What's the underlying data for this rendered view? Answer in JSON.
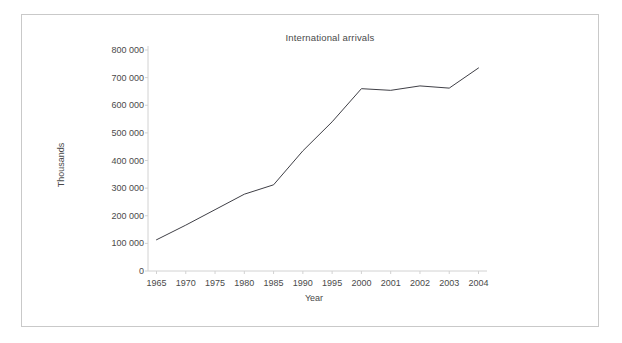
{
  "chart_data": {
    "type": "line",
    "title": "International arrivals",
    "xlabel": "Year",
    "ylabel": "Thousands",
    "categories": [
      "1965",
      "1970",
      "1975",
      "1980",
      "1985",
      "1990",
      "1995",
      "2000",
      "2001",
      "2002",
      "2003",
      "2004"
    ],
    "values": [
      113000,
      166000,
      222000,
      278000,
      312000,
      435000,
      540000,
      660000,
      654000,
      670000,
      662000,
      735000
    ],
    "series": [
      {
        "name": "International arrivals",
        "values": [
          113000,
          166000,
          222000,
          278000,
          312000,
          435000,
          540000,
          660000,
          654000,
          670000,
          662000,
          735000
        ]
      }
    ],
    "ylim": [
      0,
      800000
    ],
    "ytick_values": [
      0,
      100000,
      200000,
      300000,
      400000,
      500000,
      600000,
      700000,
      800000
    ],
    "ytick_labels": [
      "0",
      "100 000",
      "200 000",
      "300 000",
      "400 000",
      "500 000",
      "600 000",
      "700 000",
      "800 000"
    ],
    "grid": false,
    "legend": "none",
    "line_color": "#3f3f46",
    "axis_color": "#d2d2d2",
    "frame_color": "#c9c9c9",
    "background": "#ffffff"
  },
  "figure": {
    "title": "International arrivals",
    "x_axis_title": "Year",
    "y_axis_title": "Thousands"
  }
}
